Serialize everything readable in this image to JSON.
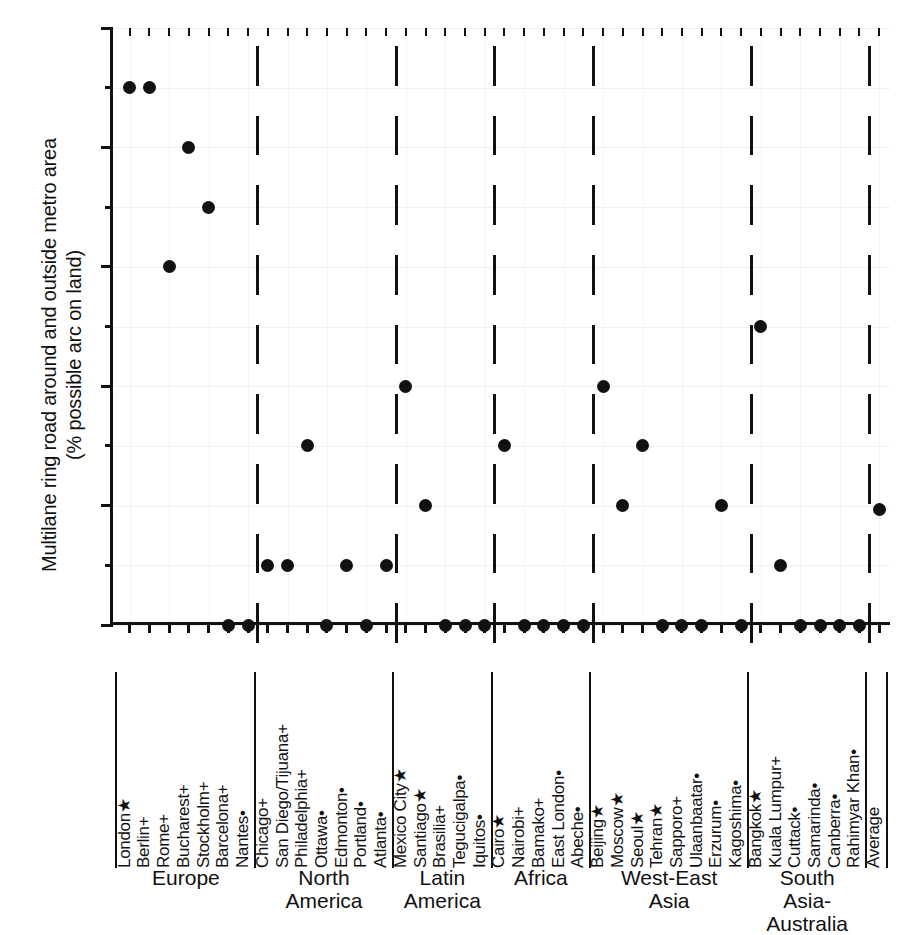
{
  "chart_data": {
    "type": "scatter",
    "title": "",
    "ylabel_line1": "Multilane ring road around and outside metro area",
    "ylabel_line2": "(% possible arc on land)",
    "xlabel": "",
    "ylim": [
      0,
      100
    ],
    "yticks": [
      0,
      20,
      40,
      60,
      80,
      100
    ],
    "yticks_minor": [
      10,
      30,
      50,
      70,
      90
    ],
    "grid": true,
    "legend": "none",
    "average_label": "Average",
    "average_value": 19.3,
    "groups": [
      {
        "name": "Europe",
        "points": [
          {
            "label": "London",
            "marker": "*",
            "value": 90
          },
          {
            "label": "Berlin",
            "marker": "+",
            "value": 90
          },
          {
            "label": "Rome",
            "marker": "+",
            "value": 60
          },
          {
            "label": "Bucharest",
            "marker": "+",
            "value": 80
          },
          {
            "label": "Stockholm",
            "marker": "+",
            "value": 70
          },
          {
            "label": "Barcelona",
            "marker": "+",
            "value": 0
          },
          {
            "label": "Nantes",
            "marker": ".",
            "value": 0
          }
        ]
      },
      {
        "name": "North\nAmerica",
        "points": [
          {
            "label": "Chicago",
            "marker": "+",
            "value": 10
          },
          {
            "label": "San Diego/Tijuana",
            "marker": "+",
            "value": 10
          },
          {
            "label": "Philadelphia",
            "marker": "+",
            "value": 30
          },
          {
            "label": "Ottawa",
            "marker": ".",
            "value": 0
          },
          {
            "label": "Edmonton",
            "marker": ".",
            "value": 10
          },
          {
            "label": "Portland",
            "marker": ".",
            "value": 0
          },
          {
            "label": "Atlanta",
            "marker": ".",
            "value": 10
          }
        ]
      },
      {
        "name": "Latin\nAmerica",
        "points": [
          {
            "label": "Mexico City",
            "marker": "*",
            "value": 40
          },
          {
            "label": "Santiago",
            "marker": "*",
            "value": 20
          },
          {
            "label": "Brasilia",
            "marker": "+",
            "value": 0
          },
          {
            "label": "Tegucigalpa",
            "marker": ".",
            "value": 0
          },
          {
            "label": "Iquitos",
            "marker": ".",
            "value": 0
          }
        ]
      },
      {
        "name": "Africa",
        "points": [
          {
            "label": "Cairo",
            "marker": "*",
            "value": 30
          },
          {
            "label": "Nairobi",
            "marker": "+",
            "value": 0
          },
          {
            "label": "Bamako",
            "marker": "+",
            "value": 0
          },
          {
            "label": "East London",
            "marker": ".",
            "value": 0
          },
          {
            "label": "Abeche",
            "marker": ".",
            "value": 0
          }
        ]
      },
      {
        "name": "West-East\nAsia",
        "points": [
          {
            "label": "Beijing",
            "marker": "*",
            "value": 40
          },
          {
            "label": "Moscow",
            "marker": "*",
            "value": 20
          },
          {
            "label": "Seoul",
            "marker": "*",
            "value": 30
          },
          {
            "label": "Tehran",
            "marker": "*",
            "value": 0
          },
          {
            "label": "Sapporo",
            "marker": "+",
            "value": 0
          },
          {
            "label": "Ulaanbaatar",
            "marker": ".",
            "value": 0
          },
          {
            "label": "Erzurum",
            "marker": ".",
            "value": 20
          },
          {
            "label": "Kagoshima",
            "marker": ".",
            "value": 0
          }
        ]
      },
      {
        "name": "South Asia-\nAustralia",
        "points": [
          {
            "label": "Bangkok",
            "marker": "*",
            "value": 50
          },
          {
            "label": "Kuala Lumpur",
            "marker": "+",
            "value": 10
          },
          {
            "label": "Cuttack",
            "marker": ".",
            "value": 0
          },
          {
            "label": "Samarinda",
            "marker": ".",
            "value": 0
          },
          {
            "label": "Canberra",
            "marker": ".",
            "value": 0
          },
          {
            "label": "Rahimyar Khan",
            "marker": ".",
            "value": 0
          }
        ]
      }
    ]
  },
  "colors": {
    "axis": "#111111",
    "marker": "#111111",
    "grid": "#f0f0f0",
    "background": "#ffffff"
  }
}
